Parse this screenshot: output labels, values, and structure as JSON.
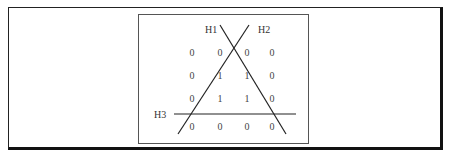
{
  "diagram": {
    "lines": [
      {
        "label": "H1",
        "from": [
          220,
          25
        ],
        "to": [
          286,
          134
        ],
        "label_pos": [
          205,
          33
        ]
      },
      {
        "label": "H2",
        "from": [
          249,
          25
        ],
        "to": [
          178,
          134
        ],
        "label_pos": [
          258,
          33
        ]
      },
      {
        "label": "H3",
        "from": [
          174,
          114
        ],
        "to": [
          296,
          114
        ],
        "label_pos": [
          154,
          118
        ]
      }
    ],
    "grid": {
      "columns_x": [
        192,
        220,
        247,
        272
      ],
      "rows_y": [
        56,
        79,
        102,
        130
      ],
      "values": [
        [
          "0",
          "0",
          "0",
          "0"
        ],
        [
          "0",
          "1",
          "1",
          "0"
        ],
        [
          "0",
          "1",
          "1",
          "0"
        ],
        [
          "0",
          "0",
          "0",
          "0"
        ]
      ]
    }
  }
}
